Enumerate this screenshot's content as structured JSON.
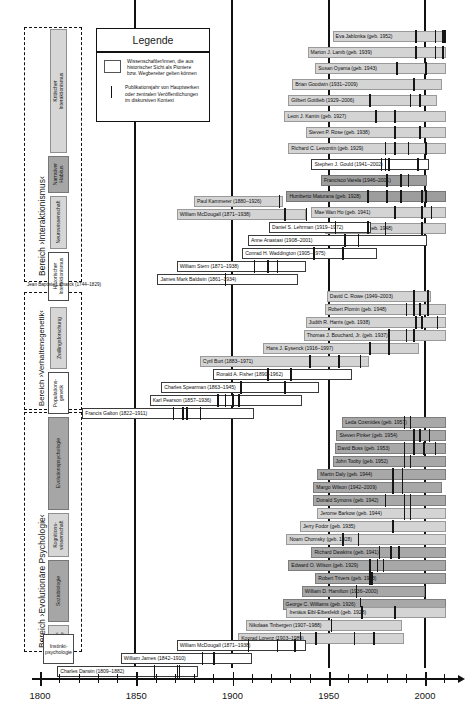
{
  "axis": {
    "name": "timeline-axis",
    "min": 1800,
    "max": 2012,
    "labels": [
      "1800",
      "1850",
      "1900",
      "1950",
      "2000"
    ],
    "label_years": [
      1800,
      1850,
      1900,
      1950,
      2000
    ],
    "minor_step": 10
  },
  "gridlines": [
    1850,
    1900,
    1950,
    2000
  ],
  "legend": {
    "title": "Legende",
    "items": [
      {
        "symbol": "box",
        "text": "Wissenschaftler/innen, die aus\nhistorischer Sicht als Pioniere\nbzw. Wegbereiter gelten können"
      },
      {
        "symbol": "line",
        "text": "Publikationsjahr von Hauptwerken\noder zentralen Veröffentlichungen\nim diskursiven Kontext"
      }
    ]
  },
  "areas": [
    {
      "label": "Bereich ›Interaktionismus‹"
    },
    {
      "label": "Bereich ›Verhaltensgenetik‹"
    },
    {
      "label": "Bereich ›Evolutionäre Psychologie‹"
    }
  ],
  "categories": [
    {
      "label": "Kritischer Interaktionismus",
      "style": "grey"
    },
    {
      "label": "Narrativer\nHabitus",
      "style": "dark"
    },
    {
      "label": "Neurowissenschaft",
      "style": "grey"
    },
    {
      "label": "Historischer\nInteraktionismus",
      "style": "light"
    },
    {
      "label": "Zwillingsforschung",
      "style": "grey"
    },
    {
      "label": "Populations-\ngenetik",
      "style": "light"
    },
    {
      "label": "Evolutionspsychologie",
      "style": "dark"
    },
    {
      "label": "Kognitions-\nwissenschaft",
      "style": "grey"
    },
    {
      "label": "Soziobiologie",
      "style": "dark"
    },
    {
      "label": "›Human-‹\nEthologie",
      "style": "grey"
    },
    {
      "label": "Instinkt-\npsychologie",
      "style": "light"
    }
  ],
  "lamarck_note": "Jean Baptiste Lamarck (1744–1829)",
  "people": [
    {
      "name": "Eva Jablonka (geb. 1952)",
      "start": 1952,
      "end": 2011,
      "style": "grey",
      "pubs": [
        1995,
        2005,
        2009,
        2010
      ]
    },
    {
      "name": "Marion J. Lamb (geb. 1939)",
      "start": 1939,
      "end": 2011,
      "style": "grey",
      "pubs": [
        1995,
        2005,
        2009
      ]
    },
    {
      "name": "Susan Oyama (geb. 1943)",
      "start": 1943,
      "end": 2011,
      "style": "grey",
      "pubs": [
        1985,
        2000
      ]
    },
    {
      "name": "Brian Goodwin (1931–2009)",
      "start": 1931,
      "end": 2009,
      "style": "grey",
      "pubs": [
        1994
      ]
    },
    {
      "name": "Gilbert Gottlieb (1929–2006)",
      "start": 1929,
      "end": 2006,
      "style": "grey",
      "pubs": [
        1971,
        1992,
        1997
      ]
    },
    {
      "name": "Leon J. Kamin (geb. 1927)",
      "start": 1927,
      "end": 2011,
      "style": "grey",
      "pubs": [
        1974,
        1984
      ]
    },
    {
      "name": "Steven P. Rose (geb. 1938)",
      "start": 1938,
      "end": 2011,
      "style": "grey",
      "pubs": [
        1984,
        1997
      ]
    },
    {
      "name": "Richard C. Lewontin (geb. 1929)",
      "start": 1929,
      "end": 2011,
      "style": "grey",
      "pubs": [
        1979,
        1984,
        1991,
        2000
      ]
    },
    {
      "name": "Stephen J. Gould (1941–2002)",
      "start": 1941,
      "end": 2002,
      "style": "light",
      "pubs": [
        1977,
        1979,
        1981,
        1996
      ]
    },
    {
      "name": "Francisco Varela (1946–2001)",
      "start": 1946,
      "end": 2001,
      "style": "dark2",
      "pubs": [
        1980,
        1987,
        1991
      ]
    },
    {
      "name": "Humberto Maturana (geb. 1928)",
      "start": 1928,
      "end": 2011,
      "style": "dark2",
      "pubs": [
        1970,
        1980,
        1987,
        1998,
        2000
      ]
    },
    {
      "name": "Mae Wan Ho (geb. 1941)",
      "start": 1941,
      "end": 2011,
      "style": "grey",
      "pubs": [
        1984,
        1998,
        2003
      ]
    },
    {
      "name": "Edward J. Steele (geb. 1948)",
      "start": 1948,
      "end": 2011,
      "style": "grey",
      "pubs": [
        1979,
        1998
      ]
    },
    {
      "name": "Paul Kammerer (1880–1926)",
      "start": 1880,
      "end": 1926,
      "style": "grey",
      "pubs": [
        1924
      ]
    },
    {
      "name": "William McDougall (1871–1938)",
      "start": 1871,
      "end": 1938,
      "style": "grey",
      "pubs": [
        1927,
        1938
      ]
    },
    {
      "name": "Daniel S. Lehrman (1919–1972)",
      "start": 1919,
      "end": 1972,
      "style": "light",
      "pubs": [
        1953,
        1970
      ]
    },
    {
      "name": "Anne Anastasi (1908–2001)",
      "start": 1908,
      "end": 2001,
      "style": "light",
      "pubs": [
        1958,
        1965
      ]
    },
    {
      "name": "Conrad H. Waddington (1905–1975)",
      "start": 1905,
      "end": 1975,
      "style": "light",
      "pubs": [
        1942,
        1957
      ]
    },
    {
      "name": "William Stern (1871–1938)",
      "start": 1871,
      "end": 1938,
      "style": "light",
      "pubs": [
        1911,
        1918,
        1923
      ]
    },
    {
      "name": "James Mark Baldwin (1861–1934)",
      "start": 1861,
      "end": 1934,
      "style": "light",
      "pubs": [
        1896
      ]
    },
    {
      "name": "David C. Rowe (1949–2003)",
      "start": 1949,
      "end": 2003,
      "style": "grey",
      "pubs": [
        1994,
        2001
      ]
    },
    {
      "name": "Robert Plomin (geb. 1948)",
      "start": 1948,
      "end": 2011,
      "style": "grey",
      "pubs": [
        1990,
        1994,
        1997,
        2001
      ]
    },
    {
      "name": "Judith R. Harris (geb. 1938)",
      "start": 1938,
      "end": 2011,
      "style": "grey",
      "pubs": [
        1995,
        1998,
        2006
      ]
    },
    {
      "name": "Thomas J. Bouchard, Jr. (geb. 1937)",
      "start": 1937,
      "end": 2011,
      "style": "grey",
      "pubs": [
        1981,
        1990,
        1994
      ]
    },
    {
      "name": "Hans J. Eysenck (1916–1997)",
      "start": 1916,
      "end": 1997,
      "style": "grey",
      "pubs": [
        1971,
        1981
      ]
    },
    {
      "name": "Cyril Burt (1883–1971)",
      "start": 1883,
      "end": 1971,
      "style": "grey",
      "pubs": [
        1940,
        1955,
        1966
      ]
    },
    {
      "name": "Ronald A. Fisher (1890–1962)",
      "start": 1890,
      "end": 1962,
      "style": "light",
      "pubs": [
        1918,
        1930
      ]
    },
    {
      "name": "Charles Spearman (1863–1945)",
      "start": 1863,
      "end": 1945,
      "style": "light",
      "pubs": [
        1904,
        1927
      ]
    },
    {
      "name": "Karl Pearson (1857–1936)",
      "start": 1857,
      "end": 1936,
      "style": "light",
      "pubs": [
        1892,
        1896,
        1900,
        1903
      ]
    },
    {
      "name": "Francis Galton (1822–1911)",
      "start": 1822,
      "end": 1911,
      "style": "light",
      "pubs": [
        1869,
        1874,
        1876,
        1883
      ]
    },
    {
      "name": "Leda Cosmides (geb. 1957)",
      "start": 1957,
      "end": 2011,
      "style": "dark",
      "pubs": [
        1989,
        1992
      ]
    },
    {
      "name": "Steven Pinker (geb. 1954)",
      "start": 1954,
      "end": 2011,
      "style": "dark",
      "pubs": [
        1994,
        1997,
        2002
      ]
    },
    {
      "name": "David Buss (geb. 1953)",
      "start": 1953,
      "end": 2011,
      "style": "dark",
      "pubs": [
        1989,
        1994,
        1999,
        2005
      ]
    },
    {
      "name": "John Tooby (geb. 1952)",
      "start": 1952,
      "end": 2011,
      "style": "dark",
      "pubs": [
        1989,
        1992
      ]
    },
    {
      "name": "Martin Daly (geb. 1944)",
      "start": 1944,
      "end": 2011,
      "style": "dark",
      "pubs": [
        1983,
        1988
      ]
    },
    {
      "name": "Margo Wilson (1942–2009)",
      "start": 1942,
      "end": 2009,
      "style": "dark",
      "pubs": [
        1983,
        1988
      ]
    },
    {
      "name": "Donald Symons (geb. 1942)",
      "start": 1942,
      "end": 2011,
      "style": "dark",
      "pubs": [
        1979,
        1989,
        1992
      ]
    },
    {
      "name": "Jerome Barkow (geb. 1944)",
      "start": 1944,
      "end": 2011,
      "style": "grey",
      "pubs": [
        1989,
        1992
      ]
    },
    {
      "name": "Jerry Fodor (geb. 1935)",
      "start": 1935,
      "end": 2011,
      "style": "grey",
      "pubs": [
        1983
      ]
    },
    {
      "name": "Noam Chomsky (geb. 1928)",
      "start": 1928,
      "end": 2011,
      "style": "grey",
      "pubs": [
        1957,
        1965
      ]
    },
    {
      "name": "Richard Dawkins (geb. 1941)",
      "start": 1941,
      "end": 2011,
      "style": "dark",
      "pubs": [
        1976,
        1982,
        1986
      ]
    },
    {
      "name": "Edward O. Wilson (geb. 1929)",
      "start": 1929,
      "end": 2011,
      "style": "dark",
      "pubs": [
        1971,
        1975,
        1978
      ]
    },
    {
      "name": "Robert Trivers (geb. 1943)",
      "start": 1943,
      "end": 2011,
      "style": "dark",
      "pubs": [
        1971,
        1972
      ]
    },
    {
      "name": "William D. Hamilton (1936–2000)",
      "start": 1936,
      "end": 2000,
      "style": "dark",
      "pubs": [
        1964
      ]
    },
    {
      "name": "George C. Williams (geb. 1926)",
      "start": 1926,
      "end": 2011,
      "style": "dark",
      "pubs": [
        1966
      ]
    },
    {
      "name": "Irenäus Eibl-Eibesfeldt (geb. 1928)",
      "start": 1928,
      "end": 2011,
      "style": "grey",
      "pubs": [
        1967,
        1984
      ]
    },
    {
      "name": "Nikolaas Tinbergen (1907–1988)",
      "start": 1907,
      "end": 1988,
      "style": "grey",
      "pubs": [
        1951
      ]
    },
    {
      "name": "Konrad Lorenz (1903–1989)",
      "start": 1903,
      "end": 1989,
      "style": "grey",
      "pubs": [
        1935,
        1943,
        1963,
        1973
      ]
    },
    {
      "name": "William McDougall (1871–1938)",
      "start": 1871,
      "end": 1938,
      "style": "light",
      "pubs": [
        1908,
        1923,
        1932
      ]
    },
    {
      "name": "William James (1842–1910)",
      "start": 1842,
      "end": 1910,
      "style": "light",
      "pubs": [
        1884,
        1890
      ]
    },
    {
      "name": "Charles Darwin (1809–1882)",
      "start": 1809,
      "end": 1882,
      "style": "light",
      "pubs": [
        1859,
        1871,
        1872
      ]
    }
  ],
  "row_y": [
    30,
    46,
    62,
    78,
    94,
    110,
    126,
    142,
    158,
    174,
    190,
    206,
    222,
    238,
    254,
    270,
    286,
    302,
    318,
    334,
    350,
    366,
    382,
    398,
    414,
    430,
    446,
    462,
    478,
    494,
    510,
    526,
    542,
    558,
    574,
    590,
    606,
    622,
    638,
    654,
    670,
    686,
    702,
    718,
    734,
    750,
    766,
    782,
    798,
    814,
    830
  ],
  "layout": {
    "x1800": 40,
    "x2000": 425,
    "px_per_year": 1.925,
    "row_tops": [
      31,
      47,
      63,
      79,
      95,
      111,
      127,
      143,
      159,
      175,
      191,
      207,
      223,
      197,
      213,
      229,
      245,
      261,
      277,
      293
    ]
  }
}
